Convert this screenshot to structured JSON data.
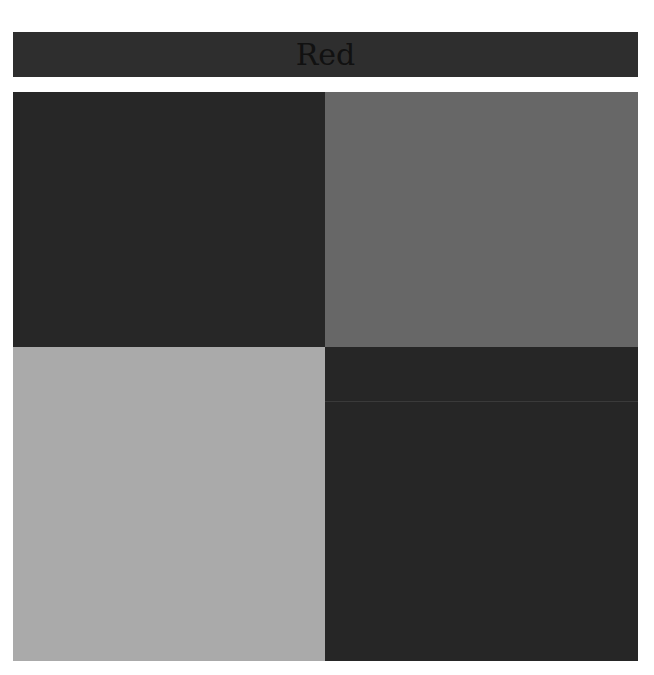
{
  "title": "Red",
  "colors": {
    "title_bar": "#2e2e2e",
    "top_left": "#272727",
    "top_right": "#676767",
    "bottom_left": "#aaaaaa",
    "bottom_right": "#262626"
  },
  "cells": [
    {
      "position": "top-left",
      "color": "#272727"
    },
    {
      "position": "top-right",
      "color": "#676767"
    },
    {
      "position": "bottom-left",
      "color": "#aaaaaa"
    },
    {
      "position": "bottom-right",
      "color": "#262626"
    }
  ]
}
